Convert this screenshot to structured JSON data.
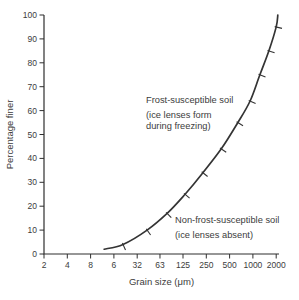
{
  "figure": {
    "background": "#ffffff",
    "ink_color": "#3c3c3c",
    "axis_color": "#2f2f2f",
    "curve_color": "#343434"
  },
  "chart_data": {
    "type": "line",
    "title": "",
    "xlabel": "Grain size (μm)",
    "ylabel": "Percentage finer",
    "x_scale": "log2",
    "xlim": [
      2,
      2000
    ],
    "ylim": [
      0,
      100
    ],
    "grid": false,
    "legend": "none",
    "x_tick_values": [
      2,
      4,
      8,
      16,
      32,
      63,
      125,
      250,
      500,
      1000,
      2000
    ],
    "x_tick_labels": [
      "2",
      "4",
      "8",
      "6",
      "32",
      "63",
      "125",
      "250",
      "500",
      "1000",
      "2000"
    ],
    "y_tick_values": [
      0,
      10,
      20,
      30,
      40,
      50,
      60,
      70,
      80,
      90,
      100
    ],
    "series": [
      {
        "name": "grading-curve",
        "hatch_marks": true,
        "points": [
          {
            "grain_um": 12,
            "percent_finer": 2
          },
          {
            "grain_um": 21,
            "percent_finer": 4
          },
          {
            "grain_um": 43,
            "percent_finer": 10
          },
          {
            "grain_um": 78,
            "percent_finer": 17
          },
          {
            "grain_um": 133,
            "percent_finer": 25
          },
          {
            "grain_um": 226,
            "percent_finer": 34
          },
          {
            "grain_um": 390,
            "percent_finer": 44
          },
          {
            "grain_um": 640,
            "percent_finer": 55
          },
          {
            "grain_um": 920,
            "percent_finer": 64
          },
          {
            "grain_um": 1230,
            "percent_finer": 75
          },
          {
            "grain_um": 1610,
            "percent_finer": 85
          },
          {
            "grain_um": 2000,
            "percent_finer": 95
          },
          {
            "grain_um": 2100,
            "percent_finer": 100
          }
        ]
      }
    ],
    "annotations": [
      {
        "name": "frost-susceptible-label",
        "title": "Frost-susceptible soil",
        "sub_lines": [
          "(ice lenses form",
          "during freezing)"
        ],
        "anchor_x": 146,
        "anchor_y": 103
      },
      {
        "name": "non-frost-susceptible-label",
        "title": "Non-frost-susceptible soil",
        "sub_lines": [
          "(ice lenses absent)"
        ],
        "anchor_x": 175,
        "anchor_y": 223
      }
    ]
  }
}
